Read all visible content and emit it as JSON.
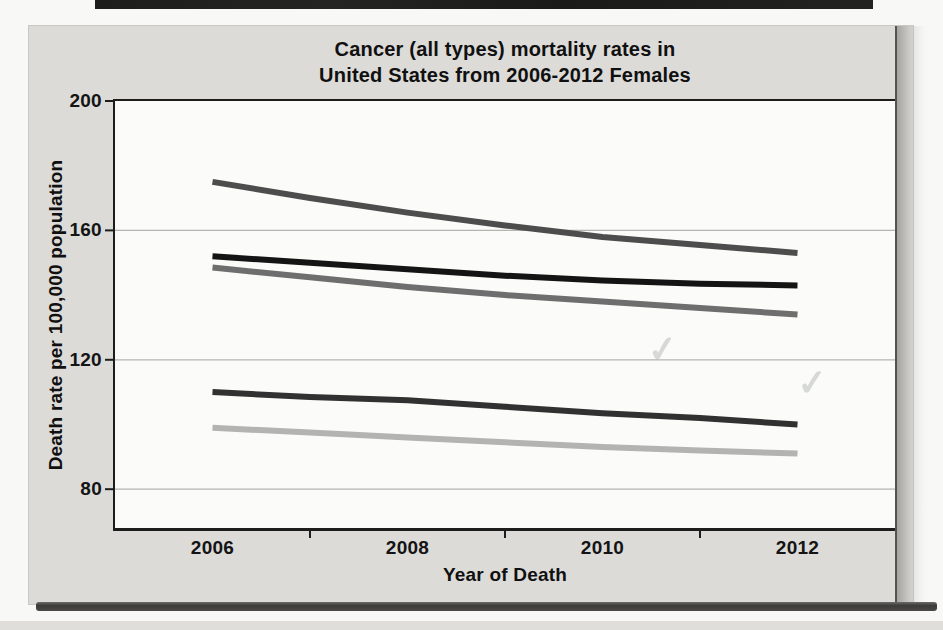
{
  "page": {
    "background": "#f8f8f6",
    "card_background": "#dcdbd8",
    "plot_background": "#fbfbf9",
    "axis_color": "#1d1d1c",
    "top_strip_color": "#1d1d1c"
  },
  "chart_data": {
    "type": "line",
    "title_line1": "Cancer (all types) mortality rates in",
    "title_line2": "United States from 2006-2012 Females",
    "xlabel": "Year of Death",
    "ylabel": "Death rate per 100,000 population",
    "x": [
      2006,
      2007,
      2008,
      2009,
      2010,
      2011,
      2012
    ],
    "xlim": [
      2005,
      2013
    ],
    "ylim": [
      68,
      200
    ],
    "ytick_values": [
      200,
      160,
      120,
      80
    ],
    "ytick_labels": [
      "200",
      "160",
      "120",
      "80"
    ],
    "xtick_label_values": [
      2006,
      2008,
      2010,
      2012
    ],
    "xtick_labels": [
      "2006",
      "2008",
      "2010",
      "2012"
    ],
    "xtick_mark_values": [
      2007,
      2009,
      2011
    ],
    "gridlines_at": [
      160,
      120,
      80
    ],
    "grid_on": true,
    "grid_color": "#b6b4b1",
    "legend": "none",
    "line_width": 6,
    "series": [
      {
        "name": "line-1-dark-gray",
        "color": "#4d4d4d",
        "values": [
          175,
          170,
          165.5,
          161.5,
          158,
          155.5,
          153
        ]
      },
      {
        "name": "line-2-black",
        "color": "#141414",
        "values": [
          152,
          150,
          148,
          146,
          144.5,
          143.5,
          143
        ]
      },
      {
        "name": "line-3-medium-gray",
        "color": "#6e6e6e",
        "values": [
          148.5,
          145.5,
          142.5,
          140,
          138,
          136,
          134
        ]
      },
      {
        "name": "line-4-charcoal",
        "color": "#313131",
        "values": [
          110,
          108.5,
          107.5,
          105.5,
          103.5,
          102,
          100
        ]
      },
      {
        "name": "line-5-light-gray",
        "color": "#b3b3b1",
        "values": [
          99,
          97.5,
          96,
          94.5,
          93,
          92,
          91
        ]
      }
    ]
  },
  "artifacts": {
    "bleedthrough_marks": [
      "✓",
      "✓"
    ]
  }
}
